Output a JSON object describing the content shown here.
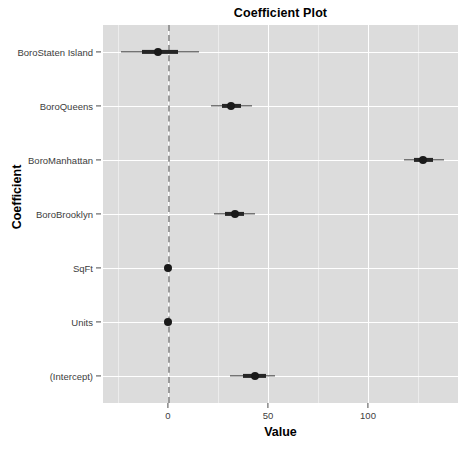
{
  "chart_data": {
    "type": "scatter",
    "title": "Coefficient Plot",
    "xlabel": "Value",
    "ylabel": "Coefficient",
    "xlim": [
      -32.5,
      145
    ],
    "xticks": [
      0,
      50,
      100
    ],
    "xtick_labels": [
      "0",
      "50",
      "100"
    ],
    "grid": true,
    "legend": "none",
    "reference_line": {
      "value": 0,
      "style": "dashed",
      "color": "#9a9a9a"
    },
    "orientation": "horizontal",
    "categories": [
      "BoroStaten Island",
      "BoroQueens",
      "BoroManhattan",
      "BoroBrooklyn",
      "SqFt",
      "Units",
      "(Intercept)"
    ],
    "series": [
      {
        "name": "Coefficient estimate with 1 and 2 standard-error intervals",
        "points": [
          {
            "category": "BoroStaten Island",
            "estimate": -5.0,
            "inner_low": -13.0,
            "inner_high": 5.0,
            "outer_low": -23.5,
            "outer_high": 15.5
          },
          {
            "category": "BoroQueens",
            "estimate": 31.5,
            "inner_low": 27.0,
            "inner_high": 36.5,
            "outer_low": 21.5,
            "outer_high": 42.0
          },
          {
            "category": "BoroManhattan",
            "estimate": 127.5,
            "inner_low": 123.0,
            "inner_high": 132.5,
            "outer_low": 118.0,
            "outer_high": 138.0
          },
          {
            "category": "BoroBrooklyn",
            "estimate": 33.5,
            "inner_low": 28.5,
            "inner_high": 38.0,
            "outer_low": 23.0,
            "outer_high": 43.5
          },
          {
            "category": "SqFt",
            "estimate": 0.0,
            "inner_low": 0.0,
            "inner_high": 0.0,
            "outer_low": 0.0,
            "outer_high": 0.0
          },
          {
            "category": "Units",
            "estimate": 0.0,
            "inner_low": 0.0,
            "inner_high": 0.0,
            "outer_low": 0.0,
            "outer_high": 0.0
          },
          {
            "category": "(Intercept)",
            "estimate": 43.5,
            "inner_low": 37.5,
            "inner_high": 49.0,
            "outer_low": 31.0,
            "outer_high": 53.5
          }
        ]
      }
    ],
    "colors": {
      "panel_background": "#dcdcdc",
      "major_gridline": "#ffffff",
      "minor_gridline": "#ececec",
      "point": "#1a1a1a",
      "inner_interval": "#262626",
      "outer_interval": "#3b3b3b",
      "zero_line": "#9a9a9a",
      "axis_text": "#3d3d3d",
      "title_text": "#000000"
    }
  }
}
